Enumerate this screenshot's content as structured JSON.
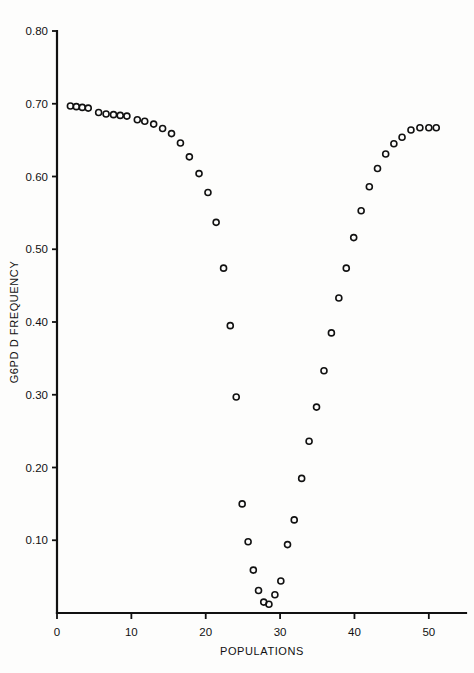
{
  "chart_data": {
    "type": "scatter",
    "title": "",
    "xlabel": "POPULATIONS",
    "ylabel": "G6PD D FREQUENCY",
    "xlim": [
      0,
      55
    ],
    "ylim": [
      0,
      0.8
    ],
    "grid": false,
    "legend": null,
    "xticks": [
      0,
      10,
      20,
      30,
      40,
      50
    ],
    "xticklabels": [
      "0",
      "10",
      "20",
      "30",
      "40",
      "50"
    ],
    "yticks": [
      0.1,
      0.2,
      0.3,
      0.4,
      0.5,
      0.6,
      0.7,
      0.8
    ],
    "yticklabels": [
      "0.10",
      "0.20",
      "0.30",
      "0.40",
      "0.50",
      "0.60",
      "0.70",
      "0.80"
    ],
    "marker": "open-circle",
    "marker_color": "#111111",
    "x": [
      1.8,
      2.6,
      3.4,
      4.2,
      5.6,
      6.6,
      7.6,
      8.5,
      9.4,
      10.8,
      11.8,
      13.0,
      14.2,
      15.4,
      16.6,
      17.8,
      19.1,
      20.3,
      21.4,
      22.4,
      23.3,
      24.1,
      24.9,
      25.7,
      26.4,
      27.1,
      27.8,
      28.5,
      29.3,
      30.1,
      31.0,
      31.9,
      32.9,
      33.9,
      34.9,
      35.9,
      36.9,
      37.9,
      38.9,
      39.9,
      40.9,
      42.0,
      43.1,
      44.2,
      45.3,
      46.4,
      47.6,
      48.8,
      50.0,
      51.0
    ],
    "y": [
      0.697,
      0.696,
      0.695,
      0.694,
      0.688,
      0.686,
      0.685,
      0.684,
      0.683,
      0.678,
      0.676,
      0.672,
      0.666,
      0.659,
      0.646,
      0.627,
      0.604,
      0.578,
      0.537,
      0.474,
      0.395,
      0.297,
      0.15,
      0.098,
      0.059,
      0.031,
      0.015,
      0.012,
      0.025,
      0.044,
      0.094,
      0.128,
      0.185,
      0.236,
      0.283,
      0.333,
      0.385,
      0.433,
      0.474,
      0.516,
      0.553,
      0.586,
      0.611,
      0.631,
      0.645,
      0.654,
      0.664,
      0.667,
      0.667,
      0.667
    ]
  },
  "axes": {
    "y_axis_name": "y-axis",
    "x_axis_name": "x-axis"
  }
}
